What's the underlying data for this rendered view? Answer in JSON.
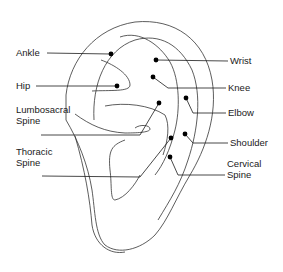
{
  "points": [
    {
      "id": "ankle",
      "label_lines": [
        "Ankle"
      ]
    },
    {
      "id": "hip",
      "label_lines": [
        "Hip"
      ]
    },
    {
      "id": "lumbosacral-spine",
      "label_lines": [
        "Lumbosacral",
        "Spine"
      ]
    },
    {
      "id": "thoracic-spine",
      "label_lines": [
        "Thoracic",
        "Spine"
      ]
    },
    {
      "id": "wrist",
      "label_lines": [
        "Wrist"
      ]
    },
    {
      "id": "knee",
      "label_lines": [
        "Knee"
      ]
    },
    {
      "id": "elbow",
      "label_lines": [
        "Elbow"
      ]
    },
    {
      "id": "shoulder",
      "label_lines": [
        "Shoulder"
      ]
    },
    {
      "id": "cervical-spine",
      "label_lines": [
        "Cervical",
        "Spine"
      ]
    }
  ]
}
